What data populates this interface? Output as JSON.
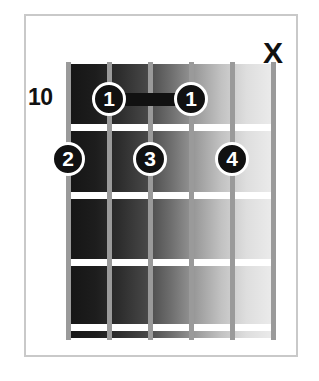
{
  "diagram": {
    "type": "guitar-chord-diagram",
    "fret_position_label": "10",
    "string_count": 6,
    "fret_count": 4,
    "colors": {
      "frame_border": "#c9c9c9",
      "background": "#ffffff",
      "fret_line": "#ffffff",
      "string": "#9a9a9a",
      "marker_fill": "#111111",
      "marker_text": "#ffffff",
      "fretboard_dark": "#141414",
      "fretboard_light": "#ededed"
    },
    "fret_lines": [
      {
        "name": "fret-line-1",
        "top": 124
      },
      {
        "name": "fret-line-2",
        "top": 192
      },
      {
        "name": "fret-line-3",
        "top": 259
      },
      {
        "name": "fret-line-4",
        "top": 324
      }
    ],
    "strings": [
      {
        "name": "string-1",
        "x": 68
      },
      {
        "name": "string-2",
        "x": 109
      },
      {
        "name": "string-3",
        "x": 150
      },
      {
        "name": "string-4",
        "x": 191
      },
      {
        "name": "string-5",
        "x": 232
      },
      {
        "name": "string-6",
        "x": 273
      }
    ],
    "finger_markers": [
      {
        "label": "1",
        "string": 2,
        "fret": 1,
        "x": 109,
        "y": 99
      },
      {
        "label": "1",
        "string": 4,
        "fret": 1,
        "x": 191,
        "y": 99
      },
      {
        "label": "2",
        "string": 1,
        "fret": 2,
        "x": 68,
        "y": 159
      },
      {
        "label": "3",
        "string": 3,
        "fret": 2,
        "x": 150,
        "y": 159
      },
      {
        "label": "4",
        "string": 5,
        "fret": 2,
        "x": 232,
        "y": 159
      }
    ],
    "barre": {
      "name": "barre-bar",
      "label": "barre",
      "from_string": 2,
      "to_string": 4,
      "fret": 1,
      "x": 109,
      "width": 82,
      "y": 99
    },
    "mute_markers": [
      {
        "label": "X",
        "string": 6,
        "x": 273,
        "y": 38
      }
    ]
  }
}
